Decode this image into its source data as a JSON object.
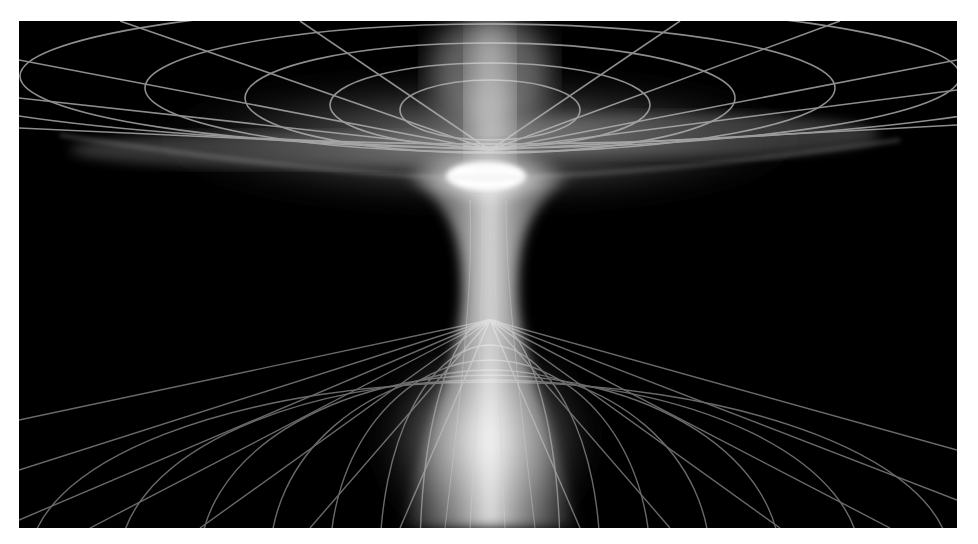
{
  "image": {
    "subject": "wormhole wireframe illustration",
    "description": "Grayscale rendering of a wormhole: an upper flattened grid funnel and a lower grid funnel joined by a glowing narrow throat, on a black background with a white border",
    "colors": {
      "background": "#000000",
      "border": "#ffffff",
      "grid": "#b8b8b8",
      "glow": "#ffffff"
    },
    "throat_center_x": 490,
    "bright_core": {
      "x": 483,
      "y": 175
    }
  }
}
